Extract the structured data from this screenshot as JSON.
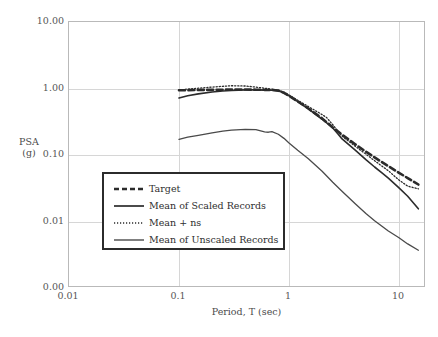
{
  "chart_data": {
    "type": "line",
    "title": "",
    "xlabel": "Period, T (sec)",
    "ylabel": "PSA\n(g)",
    "ylabel_line1": "PSA",
    "ylabel_line2": "(g)",
    "xscale": "log",
    "yscale": "log",
    "xlim": [
      0.01,
      20
    ],
    "ylim": [
      0.0015,
      10
    ],
    "grid": true,
    "legend_position": "center-left",
    "xticks": [
      0.01,
      0.1,
      1,
      10
    ],
    "xticklabels": [
      "0.01",
      "0.1",
      "1",
      "10"
    ],
    "yticks": [
      10,
      1,
      0.1,
      0.01,
      0.0015
    ],
    "yticklabels": [
      "10.00",
      "1.00",
      "0.10",
      "0.01",
      "0.00"
    ],
    "series": [
      {
        "name": "Target",
        "style": "dashed",
        "color": "#2b2b2b",
        "width": 2.6,
        "x": [
          0.1,
          0.12,
          0.15,
          0.2,
          0.25,
          0.3,
          0.4,
          0.5,
          0.6,
          0.7,
          0.8,
          0.9,
          1.0,
          1.2,
          1.5,
          2.0,
          2.5,
          3.0,
          4.0,
          5.0,
          6.0,
          7.0,
          8.0,
          10.0,
          12.0,
          15.0
        ],
        "y": [
          0.94,
          0.945,
          0.95,
          0.955,
          0.96,
          0.965,
          0.965,
          0.96,
          0.955,
          0.95,
          0.93,
          0.86,
          0.78,
          0.64,
          0.5,
          0.355,
          0.26,
          0.205,
          0.145,
          0.112,
          0.092,
          0.078,
          0.068,
          0.054,
          0.045,
          0.036
        ]
      },
      {
        "name": "Mean of Scaled Records",
        "style": "solid",
        "color": "#2b2b2b",
        "width": 1.6,
        "x": [
          0.1,
          0.12,
          0.15,
          0.2,
          0.25,
          0.3,
          0.4,
          0.5,
          0.6,
          0.7,
          0.8,
          0.9,
          1.0,
          1.2,
          1.5,
          2.0,
          2.5,
          2.8,
          3.0,
          4.0,
          5.0,
          6.0,
          7.0,
          8.0,
          10.0,
          12.0,
          15.0
        ],
        "y": [
          0.72,
          0.78,
          0.83,
          0.885,
          0.915,
          0.935,
          0.955,
          0.955,
          0.945,
          0.94,
          0.925,
          0.855,
          0.775,
          0.635,
          0.495,
          0.345,
          0.255,
          0.205,
          0.178,
          0.118,
          0.085,
          0.066,
          0.054,
          0.045,
          0.032,
          0.024,
          0.0155
        ]
      },
      {
        "name": "Mean + ns",
        "style": "dotted",
        "color": "#2b2b2b",
        "width": 1.3,
        "x": [
          0.1,
          0.12,
          0.15,
          0.2,
          0.25,
          0.3,
          0.4,
          0.5,
          0.6,
          0.7,
          0.8,
          0.9,
          1.0,
          1.2,
          1.5,
          2.0,
          2.2,
          2.5,
          2.8,
          3.0,
          4.0,
          5.0,
          6.0,
          7.0,
          8.0,
          10.0,
          12.0,
          15.0
        ],
        "y": [
          0.95,
          0.98,
          1.01,
          1.05,
          1.08,
          1.1,
          1.09,
          1.05,
          1.01,
          0.98,
          0.945,
          0.885,
          0.8,
          0.665,
          0.535,
          0.405,
          0.365,
          0.285,
          0.225,
          0.195,
          0.135,
          0.103,
          0.082,
          0.068,
          0.058,
          0.042,
          0.034,
          0.031
        ]
      },
      {
        "name": "Mean of Unscaled Records",
        "style": "solid",
        "color": "#4a4a4a",
        "width": 1.3,
        "x": [
          0.1,
          0.12,
          0.15,
          0.2,
          0.25,
          0.3,
          0.4,
          0.5,
          0.6,
          0.65,
          0.7,
          0.8,
          0.9,
          1.0,
          1.2,
          1.5,
          2.0,
          2.5,
          3.0,
          4.0,
          5.0,
          6.0,
          7.0,
          8.0,
          10.0,
          12.0,
          15.0
        ],
        "y": [
          0.172,
          0.185,
          0.198,
          0.215,
          0.228,
          0.236,
          0.243,
          0.24,
          0.223,
          0.22,
          0.225,
          0.205,
          0.178,
          0.152,
          0.118,
          0.088,
          0.057,
          0.039,
          0.029,
          0.0185,
          0.0132,
          0.0103,
          0.0085,
          0.0072,
          0.0057,
          0.0046,
          0.0037
        ]
      }
    ]
  },
  "legend": {
    "items": [
      {
        "label": "Target",
        "style": "dashed"
      },
      {
        "label": "Mean of Scaled Records",
        "style": "solid"
      },
      {
        "label": "Mean + ns",
        "style": "dotted"
      },
      {
        "label": "Mean of Unscaled Records",
        "style": "solid"
      }
    ]
  },
  "axes": {
    "x_title": "Period, T (sec)",
    "y_title_line1": "PSA",
    "y_title_line2": "(g)",
    "x_tick_0": "0.01",
    "x_tick_1": "0.1",
    "x_tick_2": "1",
    "x_tick_3": "10",
    "y_tick_0": "10.00",
    "y_tick_1": "1.00",
    "y_tick_2": "0.10",
    "y_tick_3": "0.01",
    "y_tick_4": "0.00"
  },
  "colors": {
    "axis": "#b9b9b9",
    "grid": "#d6d6d6",
    "ink": "#2b2b2b",
    "text": "#4a4a4a"
  }
}
